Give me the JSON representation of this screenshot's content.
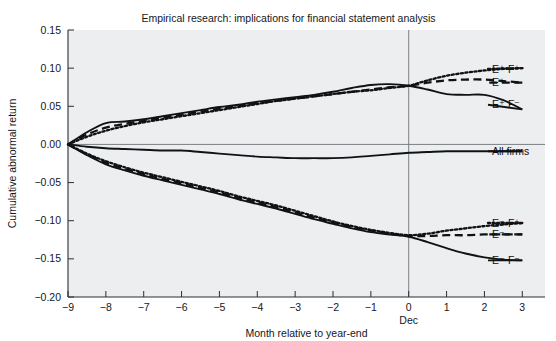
{
  "chart_data": {
    "type": "line",
    "title": "Empirical research: implications for financial statement analysis",
    "xlabel": "Month relative to year-end",
    "ylabel": "Cumulative abnormal return",
    "xlim": [
      -9,
      3.6
    ],
    "ylim": [
      -0.2,
      0.15
    ],
    "xticks": [
      -9,
      -8,
      -7,
      -6,
      -5,
      -4,
      -3,
      -2,
      -1,
      0,
      1,
      2,
      3
    ],
    "xtick_labels": [
      "−9",
      "−8",
      "−7",
      "−6",
      "−5",
      "−4",
      "−3",
      "−2",
      "−1",
      "0",
      "1",
      "2",
      "3"
    ],
    "yticks": [
      0.15,
      0.1,
      0.05,
      0.0,
      -0.05,
      -0.1,
      -0.15,
      -0.2
    ],
    "ytick_labels": [
      "0.15",
      "0.10",
      "0.05",
      "0.00",
      "−0.05",
      "−0.10",
      "−0.15",
      "−0.20"
    ],
    "zero_month_note": "Dec",
    "grid": false,
    "zero_line_y": 0.0,
    "zero_line_x": 0,
    "legend_position": "right-inline",
    "background_color": "#eceef0",
    "line_color": "#101214",
    "x": [
      -9,
      -8.5,
      -8,
      -7.5,
      -7,
      -6.5,
      -6,
      -5.5,
      -5,
      -4.5,
      -4,
      -3.5,
      -3,
      -2.5,
      -2,
      -1.5,
      -1,
      -0.5,
      0,
      0.5,
      1,
      1.5,
      2,
      2.5,
      3
    ],
    "series": [
      {
        "name": "E+ F+",
        "label": "E⁺ F⁺",
        "style": "dotted",
        "legend_y": 0.099,
        "values": [
          0.0,
          0.01,
          0.018,
          0.024,
          0.029,
          0.033,
          0.037,
          0.041,
          0.045,
          0.049,
          0.053,
          0.057,
          0.06,
          0.063,
          0.066,
          0.069,
          0.071,
          0.074,
          0.077,
          0.084,
          0.09,
          0.094,
          0.097,
          0.099,
          0.1
        ]
      },
      {
        "name": "E+",
        "label": "E⁺",
        "style": "dashed",
        "legend_y": 0.081,
        "values": [
          0.0,
          0.013,
          0.022,
          0.027,
          0.031,
          0.035,
          0.039,
          0.043,
          0.047,
          0.05,
          0.054,
          0.057,
          0.06,
          0.063,
          0.066,
          0.069,
          0.072,
          0.075,
          0.077,
          0.081,
          0.084,
          0.085,
          0.085,
          0.083,
          0.081
        ]
      },
      {
        "name": "E+ F-",
        "label": "E⁺ F⁻",
        "style": "solid",
        "legend_y": 0.052,
        "values": [
          0.0,
          0.016,
          0.028,
          0.03,
          0.033,
          0.037,
          0.041,
          0.045,
          0.049,
          0.052,
          0.056,
          0.059,
          0.062,
          0.065,
          0.069,
          0.074,
          0.078,
          0.079,
          0.077,
          0.072,
          0.066,
          0.065,
          0.065,
          0.058,
          0.046
        ]
      },
      {
        "name": "All firms",
        "label": "All firms",
        "style": "solid",
        "legend_y": -0.009,
        "values": [
          0.0,
          -0.003,
          -0.005,
          -0.006,
          -0.007,
          -0.008,
          -0.008,
          -0.01,
          -0.012,
          -0.014,
          -0.016,
          -0.017,
          -0.018,
          -0.018,
          -0.018,
          -0.017,
          -0.015,
          -0.013,
          -0.011,
          -0.01,
          -0.009,
          -0.009,
          -0.009,
          -0.009,
          -0.009
        ]
      },
      {
        "name": "E- F+",
        "label": "E⁻ F⁺",
        "style": "dotted",
        "legend_y": -0.103,
        "values": [
          0.0,
          -0.012,
          -0.022,
          -0.03,
          -0.037,
          -0.043,
          -0.049,
          -0.055,
          -0.061,
          -0.068,
          -0.074,
          -0.08,
          -0.087,
          -0.094,
          -0.101,
          -0.107,
          -0.112,
          -0.116,
          -0.119,
          -0.117,
          -0.113,
          -0.11,
          -0.107,
          -0.105,
          -0.103
        ]
      },
      {
        "name": "E-",
        "label": "E⁻",
        "style": "dashed",
        "legend_y": -0.118,
        "values": [
          0.0,
          -0.013,
          -0.024,
          -0.032,
          -0.039,
          -0.045,
          -0.051,
          -0.057,
          -0.063,
          -0.07,
          -0.076,
          -0.082,
          -0.089,
          -0.096,
          -0.102,
          -0.108,
          -0.113,
          -0.117,
          -0.12,
          -0.12,
          -0.119,
          -0.119,
          -0.118,
          -0.118,
          -0.118
        ]
      },
      {
        "name": "E- F-",
        "label": "E⁻ F⁻",
        "style": "solid",
        "legend_y": -0.152,
        "values": [
          0.0,
          -0.014,
          -0.026,
          -0.034,
          -0.041,
          -0.047,
          -0.053,
          -0.059,
          -0.065,
          -0.072,
          -0.078,
          -0.084,
          -0.091,
          -0.098,
          -0.104,
          -0.11,
          -0.115,
          -0.118,
          -0.121,
          -0.128,
          -0.136,
          -0.143,
          -0.148,
          -0.151,
          -0.152
        ]
      }
    ]
  }
}
